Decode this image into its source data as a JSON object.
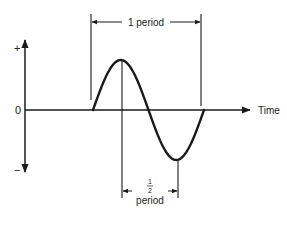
{
  "diagram": {
    "type": "sine-wave-period",
    "axis_labels": {
      "plus": "+",
      "zero": "0",
      "minus": "−",
      "time": "Time"
    },
    "full_period_label": "1 period",
    "half_period_fraction": {
      "numerator": "1",
      "denominator": "2"
    },
    "half_period_label": "period",
    "stroke_color": "#1a1a1a"
  }
}
